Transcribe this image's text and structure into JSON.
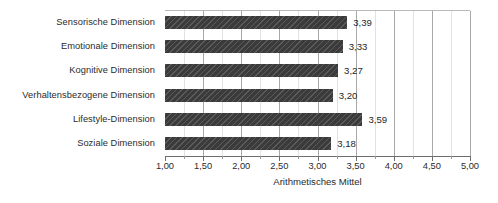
{
  "chart_data": {
    "type": "bar",
    "orientation": "horizontal",
    "title": "",
    "xlabel": "Arithmetisches Mittel",
    "ylabel": "",
    "xlim": [
      1.0,
      5.0
    ],
    "grid": true,
    "legend": null,
    "decimal_separator": ",",
    "categories": [
      "Sensorische Dimension",
      "Emotionale Dimension",
      "Kognitive Dimension",
      "Verhaltensbezogene Dimension",
      "Lifestyle-Dimension",
      "Soziale Dimension"
    ],
    "values": [
      3.39,
      3.33,
      3.27,
      3.2,
      3.59,
      3.18
    ],
    "value_labels": [
      "3,39",
      "3,33",
      "3,27",
      "3,20",
      "3,59",
      "3,18"
    ],
    "xticks": [
      1.0,
      1.5,
      2.0,
      2.5,
      3.0,
      3.5,
      4.0,
      4.5,
      5.0
    ],
    "xtick_labels": [
      "1,00",
      "1,50",
      "2,00",
      "2,50",
      "3,00",
      "3,50",
      "4,00",
      "4,50",
      "5,00"
    ],
    "minor_xticks": [
      1.25,
      1.75,
      2.25,
      2.75,
      3.25,
      3.75,
      4.25,
      4.75
    ],
    "colors": {
      "bar": "#3b3b3b",
      "background": "#ffffff",
      "gridline_major": "#a8a8a8",
      "gridline_minor": "#e2e2e2",
      "axis": "#6d6d6d",
      "text": "#2b2b2b"
    }
  }
}
